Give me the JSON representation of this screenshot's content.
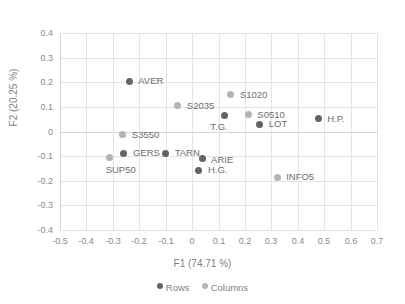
{
  "chart_data": {
    "type": "scatter",
    "title": "",
    "xlabel": "F1 (74.71 %)",
    "ylabel": "F2 (20.25 %)",
    "xlim": [
      -0.5,
      0.7
    ],
    "ylim": [
      -0.4,
      0.4
    ],
    "xticks": [
      "-0.5",
      "-0.4",
      "-0.3",
      "-0.2",
      "-0.1",
      "0",
      "0.1",
      "0.2",
      "0.3",
      "0.4",
      "0.5",
      "0.6",
      "0.7"
    ],
    "xtick_values": [
      -0.5,
      -0.4,
      -0.3,
      -0.2,
      -0.1,
      0,
      0.1,
      0.2,
      0.3,
      0.4,
      0.5,
      0.6,
      0.7
    ],
    "yticks": [
      "0.4",
      "0.3",
      "0.2",
      "0.1",
      "0",
      "-0.1",
      "-0.2",
      "-0.3",
      "-0.4"
    ],
    "ytick_values": [
      0.4,
      0.3,
      0.2,
      0.1,
      0,
      -0.1,
      -0.2,
      -0.3,
      -0.4
    ],
    "grid": true,
    "legend_position": "bottom",
    "colors": {
      "rows": "#646464",
      "columns": "#b4b4b4",
      "grid": "#e4e4e4",
      "text": "#7a7a7a"
    },
    "series": [
      {
        "name": "Rows",
        "color": "#646464",
        "points": [
          {
            "label": "AVER",
            "x": -0.238,
            "y": 0.204,
            "label_dx": 9,
            "label_dy": -5
          },
          {
            "label": "T.G.",
            "x": 0.122,
            "y": 0.066,
            "label_dx": -14,
            "label_dy": 7
          },
          {
            "label": "LOT",
            "x": 0.256,
            "y": 0.03,
            "label_dx": 9,
            "label_dy": -5
          },
          {
            "label": "H.P.",
            "x": 0.478,
            "y": 0.051,
            "label_dx": 9,
            "label_dy": -5
          },
          {
            "label": "GERS",
            "x": -0.258,
            "y": -0.089,
            "label_dx": 9,
            "label_dy": -5
          },
          {
            "label": "TARN",
            "x": -0.1,
            "y": -0.089,
            "label_dx": 9,
            "label_dy": -5
          },
          {
            "label": "ARIE",
            "x": 0.038,
            "y": -0.11,
            "label_dx": 9,
            "label_dy": -4
          },
          {
            "label": "H.G.",
            "x": 0.026,
            "y": -0.158,
            "label_dx": 9,
            "label_dy": -5
          }
        ]
      },
      {
        "name": "Columns",
        "color": "#b4b4b4",
        "points": [
          {
            "label": "S1020",
            "x": 0.147,
            "y": 0.15,
            "label_dx": 9,
            "label_dy": -5
          },
          {
            "label": "S2035",
            "x": -0.054,
            "y": 0.104,
            "label_dx": 9,
            "label_dy": -5
          },
          {
            "label": "S0510",
            "x": 0.213,
            "y": 0.068,
            "label_dx": 9,
            "label_dy": -5
          },
          {
            "label": "S3550",
            "x": -0.262,
            "y": -0.013,
            "label_dx": 9,
            "label_dy": -5
          },
          {
            "label": "SUP50",
            "x": -0.312,
            "y": -0.104,
            "label_dx": -4,
            "label_dy": 8
          },
          {
            "label": "INFO5",
            "x": 0.322,
            "y": -0.185,
            "label_dx": 9,
            "label_dy": -5
          }
        ]
      }
    ]
  }
}
